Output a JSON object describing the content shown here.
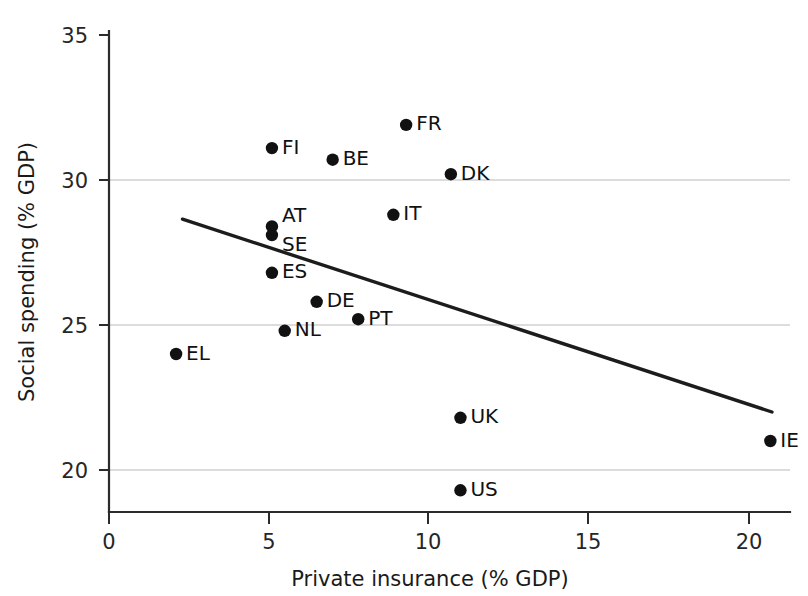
{
  "chart_data": {
    "type": "scatter",
    "title": "",
    "xlabel": "Private insurance (% GDP)",
    "ylabel": "Social spending (% GDP)",
    "xlim": [
      0,
      22.8
    ],
    "ylim": [
      18.8,
      35.2
    ],
    "xticks": [
      0,
      5,
      10,
      15,
      20
    ],
    "xticklabels": [
      "0",
      "5",
      "10",
      "15",
      "20"
    ],
    "yticks": [
      20,
      25,
      30,
      35
    ],
    "yticklabels": [
      "20",
      "25",
      "30",
      "35"
    ],
    "grid": "horizontal-only",
    "gridlines_at": [
      20,
      25,
      30
    ],
    "legend": "none",
    "marker_color": "#111111",
    "trendline_color": "#1c1c1c",
    "grid_color": "#b9b9b9",
    "axis_color": "#2b2b2b",
    "points": [
      {
        "label": "FR",
        "x": 9.3,
        "y": 31.9
      },
      {
        "label": "FI",
        "x": 5.1,
        "y": 31.1
      },
      {
        "label": "BE",
        "x": 7.0,
        "y": 30.7
      },
      {
        "label": "DK",
        "x": 10.7,
        "y": 30.2
      },
      {
        "label": "IT",
        "x": 8.9,
        "y": 28.8
      },
      {
        "label": "AT",
        "x": 5.1,
        "y": 28.4
      },
      {
        "label": "SE",
        "x": 5.1,
        "y": 28.1
      },
      {
        "label": "ES",
        "x": 5.1,
        "y": 26.8
      },
      {
        "label": "DE",
        "x": 6.5,
        "y": 25.8
      },
      {
        "label": "PT",
        "x": 7.8,
        "y": 25.2
      },
      {
        "label": "NL",
        "x": 5.5,
        "y": 24.8
      },
      {
        "label": "EL",
        "x": 2.1,
        "y": 24.0
      },
      {
        "label": "UK",
        "x": 11.0,
        "y": 21.8
      },
      {
        "label": "IE",
        "x": 20.7,
        "y": 21.0
      },
      {
        "label": "US",
        "x": 11.0,
        "y": 19.3
      }
    ],
    "trendline": {
      "x0": 2.3,
      "y0": 28.65,
      "x1": 20.75,
      "y1": 22.0
    },
    "label_offsets": {
      "SE": {
        "dx": 10,
        "dy": 10
      },
      "AT": {
        "dx": 10,
        "dy": -10
      },
      "default": {
        "dx": 10,
        "dy": 0
      }
    }
  }
}
